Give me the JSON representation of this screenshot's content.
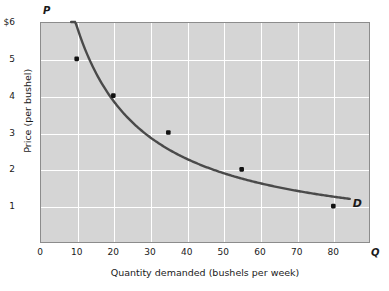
{
  "chart_data": {
    "type": "line",
    "title": "",
    "xlabel": "Quantity demanded (bushels per week)",
    "ylabel": "Price (per bushel)",
    "x_axis_symbol": "Q",
    "y_axis_symbol": "P",
    "xlim": [
      0,
      90
    ],
    "ylim": [
      0,
      6
    ],
    "grid": true,
    "legend_position": "none",
    "x_ticks": [
      {
        "value": 0,
        "label": "0"
      },
      {
        "value": 10,
        "label": "10"
      },
      {
        "value": 20,
        "label": "20"
      },
      {
        "value": 30,
        "label": "30"
      },
      {
        "value": 40,
        "label": "40"
      },
      {
        "value": 50,
        "label": "50"
      },
      {
        "value": 60,
        "label": "60"
      },
      {
        "value": 70,
        "label": "70"
      },
      {
        "value": 80,
        "label": "80"
      }
    ],
    "y_ticks": [
      {
        "value": 1,
        "label": "1"
      },
      {
        "value": 2,
        "label": "2"
      },
      {
        "value": 3,
        "label": "3"
      },
      {
        "value": 4,
        "label": "4"
      },
      {
        "value": 5,
        "label": "5"
      },
      {
        "value": 6,
        "label": "$6"
      }
    ],
    "series": [
      {
        "name": "D",
        "annotation": "D",
        "color": "#4a4a4a",
        "line_width": 2.4,
        "marker": "square",
        "marker_color": "#111111",
        "x": [
          10,
          20,
          35,
          55,
          80
        ],
        "y": [
          5,
          4,
          3,
          2,
          1
        ],
        "points": [
          {
            "quantity": 10,
            "price": 5
          },
          {
            "quantity": 20,
            "price": 4
          },
          {
            "quantity": 35,
            "price": 3
          },
          {
            "quantity": 55,
            "price": 2
          },
          {
            "quantity": 80,
            "price": 1
          }
        ],
        "curve_extent_x": [
          8.5,
          84.5
        ]
      }
    ]
  },
  "colors": {
    "plot_background": "#d5d5d5",
    "grid": "#ffffff",
    "frame": "#8c8c8c",
    "curve": "#4a4a4a",
    "marker": "#111111",
    "text": "#1a1a1a",
    "page_background": "#ffffff"
  }
}
